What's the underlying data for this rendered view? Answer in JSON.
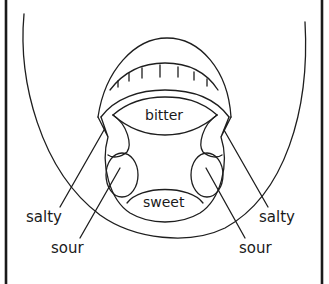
{
  "diagram": {
    "regions": {
      "bitter": "bitter",
      "sweet": "sweet"
    },
    "labels": {
      "salty_left": "salty",
      "sour_left": "sour",
      "salty_right": "salty",
      "sour_right": "sour"
    }
  }
}
